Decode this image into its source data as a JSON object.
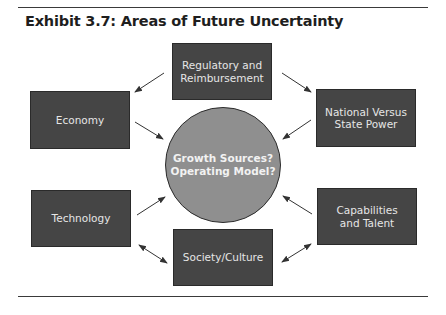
{
  "exhibit": {
    "title": "Exhibit 3.7: Areas of Future Uncertainty"
  },
  "center": {
    "line1": "Growth Sources?",
    "line2": "Operating Model?"
  },
  "nodes": {
    "regulatory": {
      "line1": "Regulatory and",
      "line2": "Reimbursement"
    },
    "economy": {
      "label": "Economy"
    },
    "national": {
      "line1": "National Versus",
      "line2": "State Power"
    },
    "technology": {
      "label": "Technology"
    },
    "capabilities": {
      "line1": "Capabilities",
      "line2": "and Talent"
    },
    "society": {
      "label": "Society/Culture"
    }
  },
  "colors": {
    "box_fill": "#454545",
    "circle_fill": "#8f8f8f",
    "text_light": "#e6e6e6",
    "arrow": "#333333"
  }
}
